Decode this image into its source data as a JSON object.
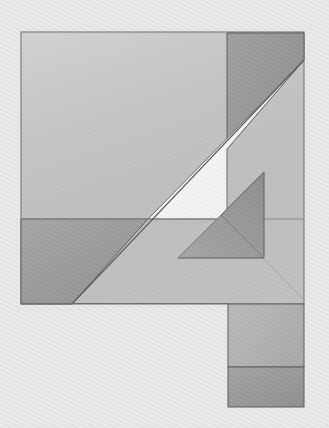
{
  "canvas": {
    "width": 329,
    "height": 428,
    "background_color": "#e2e2e2",
    "texture": "diagonal-hatch-lines",
    "texture_color": "#ffffff",
    "texture_angle_deg": 115,
    "title": "Abstract Geometric Composition"
  },
  "palette": {
    "background": "#e2e2e2",
    "background_highlight": "#efefef",
    "light_square": "#c9c9c9",
    "light_square_alt": "#cccccc",
    "bright_triangle_top": "#eeeeee",
    "bright_triangle_bottom": "#f2f2f2",
    "dark_strip": "#9a9a9a",
    "dark_strip_alt": "#a0a0a0",
    "left_quad": "#9e9e9e",
    "left_quad_alt": "#a3a3a3",
    "inner_triangle_left": "#a8a8a8",
    "inner_triangle_right": "#9b9b9b",
    "bottom_rect_upper": "#b5b5b5",
    "bottom_rect_lower": "#9c9c9c",
    "outline": "#5e5e5e",
    "outline_soft": "#8d8d8d"
  },
  "shapes": [
    {
      "id": "main-square",
      "name": "large-light-square",
      "type": "rect",
      "x": 21,
      "y": 32,
      "width": 283,
      "height": 272,
      "fill": "#c9c9c9",
      "stroke": "#6b6b6b",
      "stroke_width": 1
    },
    {
      "id": "dark-strip",
      "name": "dark-vertical-strip-top-right",
      "type": "polygon",
      "points": "227,33 304,33 304,60 227,149",
      "fill": "#9a9a9a",
      "stroke": "#5e5e5e",
      "stroke_width": 1
    },
    {
      "id": "bright-triangle",
      "name": "bright-wedge-triangle",
      "type": "polygon",
      "points": "304,60 227,149 227,219 148,219",
      "fill": "#efefef",
      "stroke": "#5e5e5e",
      "stroke_width": 1
    },
    {
      "id": "left-quad",
      "name": "dark-left-quadrilateral",
      "type": "polygon",
      "points": "21,219 148,219 72,304 21,304",
      "fill": "#9e9e9e",
      "stroke": "#5e5e5e",
      "stroke_width": 1
    },
    {
      "id": "inner-triangle",
      "name": "inner-dark-triangle",
      "type": "polygon",
      "points": "264,172 264,258 178,258",
      "fill": "#a4a4a4",
      "stroke": "#5e5e5e",
      "stroke_width": 1
    },
    {
      "id": "inner-triangle-fold",
      "name": "inner-triangle-fold-crease",
      "type": "polyline",
      "points": "178,258 221,215 264,258",
      "stroke": "#767676",
      "stroke_width": 1
    },
    {
      "id": "main-diagonal",
      "name": "main-diagonal-line",
      "type": "line",
      "x1": 304,
      "y1": 60,
      "x2": 72,
      "y2": 304,
      "stroke": "#5e5e5e",
      "stroke_width": 1
    },
    {
      "id": "mid-horizontal",
      "name": "mid-horizontal-line",
      "type": "line",
      "x1": 21,
      "y1": 219,
      "x2": 304,
      "y2": 219,
      "stroke": "#7b7b7b",
      "stroke_width": 1
    },
    {
      "id": "lower-diagonal",
      "name": "lower-faint-diagonal",
      "type": "line",
      "x1": 221,
      "y1": 215,
      "x2": 304,
      "y2": 300,
      "stroke": "#a2a2a2",
      "stroke_width": 1
    },
    {
      "id": "bottom-rect-upper",
      "name": "bottom-right-rectangle-upper",
      "type": "rect",
      "x": 228,
      "y": 304,
      "width": 76,
      "height": 63,
      "fill": "#b5b5b5",
      "stroke": "#5e5e5e",
      "stroke_width": 1
    },
    {
      "id": "bottom-rect-lower",
      "name": "bottom-right-rectangle-lower",
      "type": "rect",
      "x": 228,
      "y": 367,
      "width": 76,
      "height": 40,
      "fill": "#9c9c9c",
      "stroke": "#5e5e5e",
      "stroke_width": 1
    }
  ],
  "labels": {
    "alt_text": "Abstract geometric composition of overlapping gray quadrilaterals and triangles resembling a tangram figure on a lightly textured background"
  }
}
